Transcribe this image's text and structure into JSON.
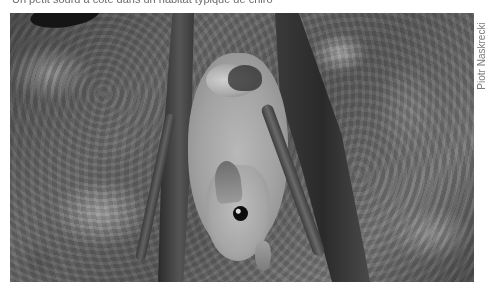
{
  "caption": {
    "text": "Un petit sourd à côté dans un habitat typique de chiro"
  },
  "photo": {
    "subject": "fruit bat with pup hanging upside down on rock",
    "style": "grayscale"
  },
  "credit": {
    "text": "Piotr Naskrecki"
  },
  "colors": {
    "background": "#ffffff",
    "caption_text": "#6b6b6b",
    "credit_text": "#7a7a7a"
  }
}
